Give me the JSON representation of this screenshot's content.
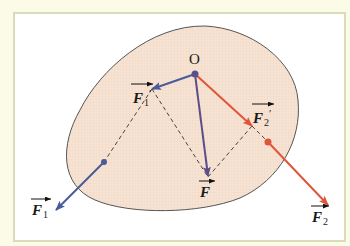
{
  "diagram": {
    "type": "force decomposition (parallelogram rule)",
    "point_label": "O",
    "colors": {
      "background": "#fbfbe8",
      "frame_border": "#d8dcb8",
      "body_fill": "#f6e3d3",
      "body_outline": "#555555",
      "blue_force": "#4a5a9a",
      "red_force": "#e0553a",
      "resultant": "#5a4f8a",
      "dashed": "#444444"
    },
    "vectors": {
      "F": {
        "label": "F",
        "sub": "",
        "prime": ""
      },
      "F1_prime": {
        "label": "F",
        "sub": "1",
        "prime": "′"
      },
      "F2_prime": {
        "label": "F",
        "sub": "2",
        "prime": "′"
      },
      "F1": {
        "label": "F",
        "sub": "1",
        "prime": ""
      },
      "F2": {
        "label": "F",
        "sub": "2",
        "prime": ""
      }
    }
  }
}
